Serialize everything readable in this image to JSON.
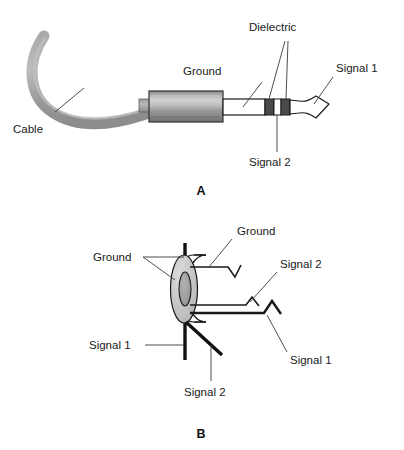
{
  "figure": {
    "panels": [
      {
        "id": "A",
        "label": "A",
        "description": "Side view of assembled stereo phone plug with cable"
      },
      {
        "id": "B",
        "label": "B",
        "description": "Rear view of plug contacts with wire leads"
      }
    ]
  },
  "panel_a": {
    "label": "A",
    "labels": {
      "cable": "Cable",
      "ground": "Ground",
      "dielectric": "Dielectric",
      "signal1": "Signal 1",
      "signal2": "Signal 2"
    }
  },
  "panel_b": {
    "label": "B",
    "labels": {
      "ground_left": "Ground",
      "ground_right": "Ground",
      "signal1_left": "Signal 1",
      "signal1_right": "Signal 1",
      "signal2_top": "Signal 2",
      "signal2_bottom": "Signal 2"
    }
  },
  "colors": {
    "background": "#ffffff",
    "outline": "#1a1a1a",
    "leader": "#3b3b3b",
    "cable": "#9a9a9a",
    "cable_highlight": "#b4b4b4",
    "barrel_light": "#cfcfcf",
    "barrel_mid": "#8f8f8f",
    "barrel_dark": "#6f6f6f",
    "dielectric_band": "#4a4a4a",
    "sleeve_white": "#ffffff",
    "ring_face": "#c8c8c8",
    "ring_hole": "#9e9e9e",
    "text": "#1a1a1a"
  }
}
